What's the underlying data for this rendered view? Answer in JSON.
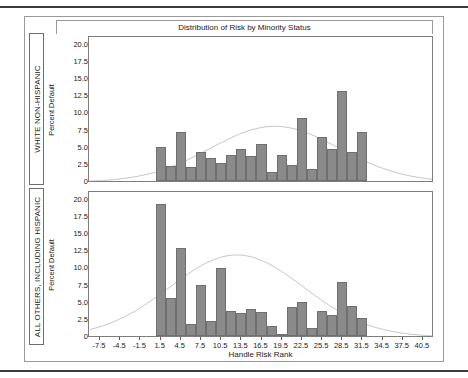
{
  "chart_data": {
    "type": "bar",
    "title": "Distribution of Risk by Minority Status",
    "xlabel": "Handle Risk Rank",
    "ylabel": "Percent Default",
    "xlim": [
      -9.0,
      42.0
    ],
    "ylim": [
      0,
      21.0
    ],
    "grid": false,
    "legend_position": "none",
    "xticks": [
      "-7.5",
      "-4.5",
      "-1.5",
      "1.5",
      "4.5",
      "7.5",
      "10.5",
      "13.5",
      "16.5",
      "19.5",
      "22.5",
      "25.5",
      "28.5",
      "31.5",
      "34.5",
      "37.5",
      "40.5"
    ],
    "xtick_values": [
      -7.5,
      -4.5,
      -1.5,
      1.5,
      4.5,
      7.5,
      10.5,
      13.5,
      16.5,
      19.5,
      22.5,
      25.5,
      28.5,
      31.5,
      34.5,
      37.5,
      40.5
    ],
    "yticks": [
      "0",
      "2.5",
      "5.0",
      "7.5",
      "10.0",
      "12.5",
      "15.0",
      "17.5",
      "20.0"
    ],
    "ytick_values": [
      0,
      2.5,
      5.0,
      7.5,
      10.0,
      12.5,
      15.0,
      17.5,
      20.0
    ],
    "bar_width": 1.5,
    "panels": [
      {
        "group_label": "WHITE NON-HISPANIC",
        "ylabel": "Percent Default",
        "x": [
          1.5,
          3.0,
          4.5,
          6.0,
          7.5,
          9.0,
          10.5,
          12.0,
          13.5,
          15.0,
          16.5,
          18.0,
          19.5,
          21.0,
          22.5,
          24.0,
          25.5,
          27.0,
          28.5,
          30.0,
          31.5
        ],
        "values": [
          5.0,
          2.2,
          7.1,
          2.1,
          4.2,
          3.3,
          2.7,
          3.8,
          4.6,
          3.7,
          5.4,
          1.3,
          3.8,
          2.4,
          9.2,
          1.8,
          6.4,
          4.6,
          13.1,
          4.3,
          7.2
        ],
        "density_curve": true
      },
      {
        "group_label": "ALL OTHERS, INCLUDING HISPANIC",
        "ylabel": "Percent Default",
        "x": [
          1.5,
          3.0,
          4.5,
          6.0,
          7.5,
          9.0,
          10.5,
          12.0,
          13.5,
          15.0,
          16.5,
          18.0,
          19.5,
          21.0,
          22.5,
          24.0,
          25.5,
          27.0,
          28.5,
          30.0,
          31.5
        ],
        "values": [
          19.3,
          5.6,
          12.8,
          1.7,
          7.5,
          2.2,
          9.9,
          3.7,
          3.3,
          3.9,
          3.5,
          1.5,
          0.2,
          4.2,
          5.0,
          1.1,
          3.6,
          3.1,
          7.9,
          4.4,
          2.6
        ],
        "density_curve": true
      }
    ]
  }
}
